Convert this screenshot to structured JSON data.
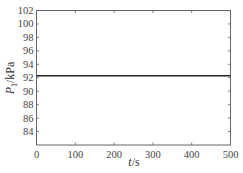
{
  "chart_data": {
    "type": "line",
    "title": "",
    "xlabel": "t/s",
    "ylabel": "P1/kPa",
    "xlim": [
      0,
      500
    ],
    "ylim": [
      82,
      102
    ],
    "x_ticks": [
      0,
      100,
      200,
      300,
      400,
      500
    ],
    "y_ticks": [
      84,
      86,
      88,
      90,
      92,
      94,
      96,
      98,
      100,
      102
    ],
    "grid": false,
    "legend": null,
    "series": [
      {
        "name": "P1",
        "x": [
          0,
          500
        ],
        "y": [
          92.3,
          92.3
        ],
        "color": "#222222"
      }
    ]
  },
  "labels": {
    "xlabel_italic": "t",
    "xlabel_unit": "/s",
    "ylabel_italic": "P",
    "ylabel_sub": "1",
    "ylabel_unit": "/kPa"
  }
}
